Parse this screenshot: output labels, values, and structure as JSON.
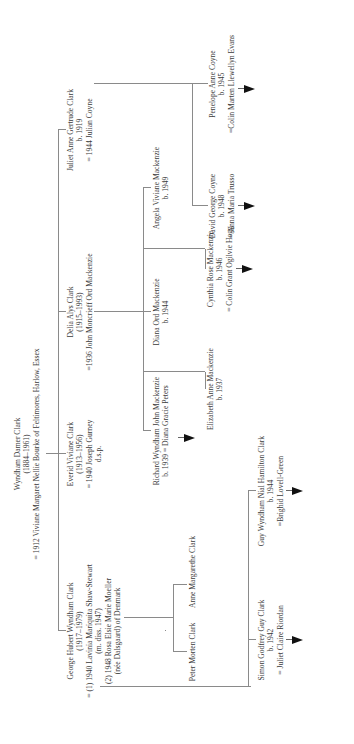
{
  "root": {
    "name": "Wyndham Damer Clark",
    "dates": "(1884–1961)",
    "marriage": "= 1912 Viviane Margaret Nellie Bourke of Feltimores, Harlow, Essex"
  },
  "generation2": [
    {
      "name": "George Hubert Wyndham Clark",
      "dates": "(1917–1979)",
      "line3": "= (1) 1940 Lavinia Mariquita Shaw-Stewart",
      "line4": "(m. diss. 1947)",
      "line5": "(2) 1948 Rosa Elsie Marie Moeller",
      "line6": "(née Dalsgaard) of Denmark"
    },
    {
      "name": "Everid Viviane Clark",
      "dates": "(1913–1956)",
      "line3": "= 1940 Joseph Gurney",
      "line4": "d.s.p."
    },
    {
      "name": "Delia Alys Clark",
      "dates": "(1915–1993)",
      "line3": "=1936 John Moncrieff Ord Mackenzie"
    },
    {
      "name": "Juliet Anne Gertrude Clark",
      "dates": "b. 1919",
      "line3": "= 1944 Julian Coyne"
    }
  ],
  "george_children_m2": [
    {
      "name": "Peter Morten Clark"
    },
    {
      "name": "Anne Margarethe Clark"
    }
  ],
  "george_children_m1": [
    {
      "name": "Simon Godfrey Guy Clark",
      "dates": "b. 1942",
      "line3": "= Juliet Claire Riordan"
    },
    {
      "name": "Guy Wyndham Nial Hamilton Clark",
      "dates": "b. 1944",
      "line3": "=Brighid Lovell-Green"
    }
  ],
  "delia_children": [
    {
      "name": "Richard Wyndham John Mackenzie",
      "dates": "b. 1939 = Diana Gracie Peters"
    },
    {
      "name": "Elizabeth Anne Mackenzie",
      "dates": "b. 1937"
    },
    {
      "name": "Diana Ord Mackenzie",
      "dates": "b. 1944"
    },
    {
      "name": "Cynthia Rose Mackenzie",
      "dates": "b. 1946",
      "line3": "= Colin Grant Ogilvie Hogg"
    },
    {
      "name": "Angela Viviane Mackenzie",
      "dates": "b. 1949"
    }
  ],
  "juliet_children": [
    {
      "name": "David George Coyne",
      "dates": "b. 1948",
      "line3": "= Anna Maria Trusso"
    },
    {
      "name": "Penelope Anne Coyne",
      "dates": "b. 1945",
      "line3": "=Colin Marten Llewellyn Evans"
    }
  ],
  "icons": {
    "descendants_arrow": "arrow-down-icon"
  }
}
